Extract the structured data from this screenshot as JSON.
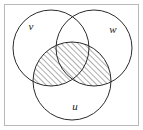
{
  "figure": {
    "type": "venn-diagram-3-set",
    "background_color": "#ffffff",
    "frame": {
      "visible": true,
      "color": "#b9b9b9",
      "x": 4,
      "y": 4,
      "width": 134,
      "height": 121
    },
    "stroke_color": "#2b2b2b",
    "stroke_width": 1,
    "sets": [
      {
        "id": "v",
        "label": "v",
        "position": "top-left",
        "cx": 51,
        "cy": 48,
        "r": 38,
        "label_x": 31,
        "label_y": 27
      },
      {
        "id": "w",
        "label": "w",
        "position": "top-right",
        "cx": 94,
        "cy": 48,
        "r": 38,
        "label_x": 113,
        "label_y": 30
      },
      {
        "id": "u",
        "label": "u",
        "position": "bottom-center",
        "cx": 72,
        "cy": 81,
        "r": 39,
        "label_x": 75,
        "label_y": 107
      }
    ],
    "shading": {
      "region_expression": "u ∩ (v ∪ w)",
      "description": "Parts of the bottom circle u that overlap circle v or circle w are hatched",
      "pattern": "diagonal-hatch",
      "hatch_angle_deg": 45,
      "hatch_spacing_px": 4,
      "hatch_color": "#333333",
      "hatch_stroke_width": 0.8,
      "fill_color": "#ffffff"
    }
  }
}
